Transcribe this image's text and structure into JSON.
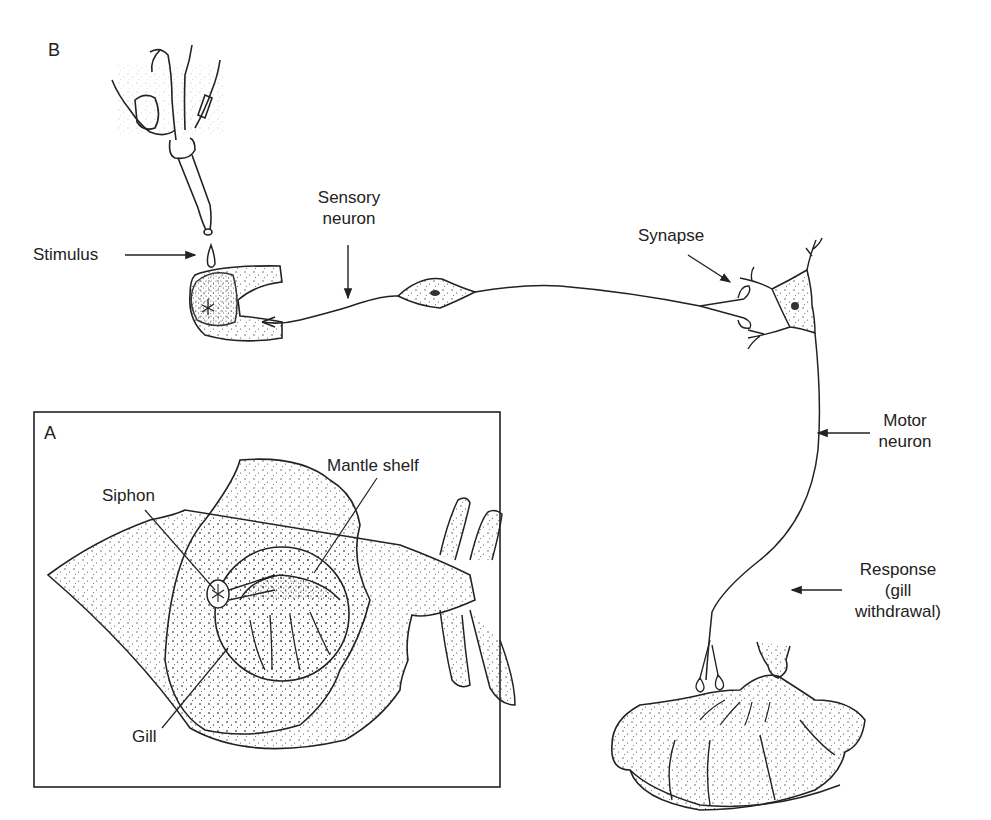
{
  "figure": {
    "panel_b": {
      "letter": "B",
      "labels": {
        "stimulus": "Stimulus",
        "sensory_neuron_line1": "Sensory",
        "sensory_neuron_line2": "neuron",
        "synapse": "Synapse",
        "motor_neuron_line1": "Motor",
        "motor_neuron_line2": "neuron",
        "response_line1": "Response",
        "response_line2": "(gill",
        "response_line3": "withdrawal)"
      }
    },
    "panel_a": {
      "letter": "A",
      "labels": {
        "siphon": "Siphon",
        "mantle_shelf": "Mantle shelf",
        "gill": "Gill"
      }
    },
    "colors": {
      "ink": "#222222",
      "background": "#ffffff"
    },
    "icons": [
      "dropper-hand-icon",
      "water-drop-icon",
      "siphon-icon",
      "sensory-cell-body-icon",
      "motor-cell-body-icon",
      "gill-icon",
      "aplysia-icon"
    ]
  }
}
